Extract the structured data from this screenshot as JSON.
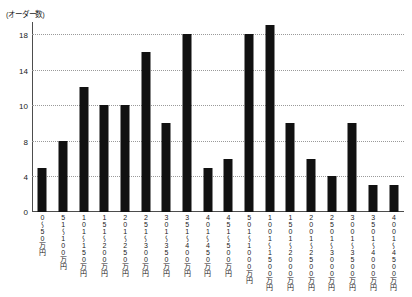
{
  "chart_data": {
    "type": "bar",
    "title": "",
    "subtitle": "",
    "ylabel": "(オーダー数)",
    "xlabel": "",
    "grid": true,
    "legend": false,
    "ylim": [
      0,
      20
    ],
    "yticks": [
      0,
      4,
      8,
      10,
      14,
      18
    ],
    "ytick_labels": [
      "0",
      "4",
      "8",
      "10",
      "14",
      "18"
    ],
    "categories": [
      "0〜50万円",
      "51〜100万円",
      "101〜150万円",
      "151〜200万円",
      "201〜250万円",
      "251〜300万円",
      "301〜350万円",
      "351〜400万円",
      "401〜450万円",
      "451〜500万円",
      "501〜1000万円",
      "1001〜1500万円",
      "1501〜2000万円",
      "2001〜2500万円",
      "2501〜3000万円",
      "3001〜3500万円",
      "3501〜4000万円",
      "4001〜4500万円"
    ],
    "values": [
      5,
      8,
      12,
      10,
      10,
      16,
      9,
      18,
      5,
      6,
      18,
      19,
      9,
      6,
      4,
      9,
      3,
      3
    ],
    "bar_color": "#111111",
    "grid_color": "#9a9a9a",
    "axis_color": "#4d4d4d"
  }
}
